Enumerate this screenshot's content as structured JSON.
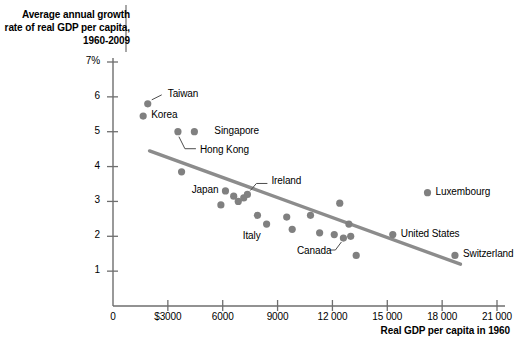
{
  "chart_data": {
    "type": "scatter",
    "title": "Average annual growth rate of real GDP per capita, 1960-2009",
    "xlabel": "Real GDP per capita in 1960",
    "ylabel": "Average annual growth rate of real GDP per capita, 1960-2009",
    "xlim": [
      0,
      21000
    ],
    "ylim": [
      0,
      7
    ],
    "grid": false,
    "legend": "none",
    "xticks": [
      "0",
      "$3000",
      "6000",
      "9000",
      "12 000",
      "15 000",
      "18 000",
      "21 000"
    ],
    "xtick_values": [
      0,
      3000,
      6000,
      9000,
      12000,
      15000,
      18000,
      21000
    ],
    "yticks": [
      "1",
      "2",
      "3",
      "4",
      "5",
      "6",
      "7%"
    ],
    "ytick_values": [
      1,
      2,
      3,
      4,
      5,
      6,
      7
    ],
    "point_color": "#808080",
    "line_color": "#8c8c8c",
    "axis_color": "#6e6e6e",
    "points": [
      {
        "label": "Taiwan",
        "x": 1900,
        "y": 5.8,
        "labeled": true
      },
      {
        "label": "Korea",
        "x": 1650,
        "y": 5.45,
        "labeled": true
      },
      {
        "label": "Hong Kong",
        "x": 3550,
        "y": 5.0,
        "labeled": true
      },
      {
        "label": "Singapore",
        "x": 4450,
        "y": 5.0,
        "labeled": true
      },
      {
        "label": "",
        "x": 3750,
        "y": 3.85,
        "labeled": false
      },
      {
        "label": "Japan",
        "x": 6150,
        "y": 3.3,
        "labeled": true
      },
      {
        "label": "",
        "x": 6600,
        "y": 3.15,
        "labeled": false
      },
      {
        "label": "",
        "x": 6850,
        "y": 3.0,
        "labeled": false
      },
      {
        "label": "",
        "x": 7150,
        "y": 3.1,
        "labeled": false
      },
      {
        "label": "Ireland",
        "x": 7350,
        "y": 3.2,
        "labeled": true
      },
      {
        "label": "",
        "x": 5900,
        "y": 2.9,
        "labeled": false
      },
      {
        "label": "",
        "x": 7900,
        "y": 2.6,
        "labeled": false
      },
      {
        "label": "Italy",
        "x": 8400,
        "y": 2.35,
        "labeled": true
      },
      {
        "label": "",
        "x": 9500,
        "y": 2.55,
        "labeled": false
      },
      {
        "label": "",
        "x": 9800,
        "y": 2.2,
        "labeled": false
      },
      {
        "label": "",
        "x": 10800,
        "y": 2.6,
        "labeled": false
      },
      {
        "label": "",
        "x": 11300,
        "y": 2.1,
        "labeled": false
      },
      {
        "label": "",
        "x": 12400,
        "y": 2.95,
        "labeled": false
      },
      {
        "label": "",
        "x": 12900,
        "y": 2.35,
        "labeled": false
      },
      {
        "label": "",
        "x": 12100,
        "y": 2.05,
        "labeled": false
      },
      {
        "label": "Canada",
        "x": 12600,
        "y": 1.95,
        "labeled": true
      },
      {
        "label": "",
        "x": 13000,
        "y": 2.0,
        "labeled": false
      },
      {
        "label": "",
        "x": 13300,
        "y": 1.45,
        "labeled": false
      },
      {
        "label": "United States",
        "x": 15300,
        "y": 2.05,
        "labeled": true
      },
      {
        "label": "Luxembourg",
        "x": 17200,
        "y": 3.25,
        "labeled": true
      },
      {
        "label": "Switzerland",
        "x": 18700,
        "y": 1.45,
        "labeled": true
      }
    ],
    "trendline": {
      "x0": 2000,
      "y0": 4.45,
      "x1": 19000,
      "y1": 1.2
    }
  }
}
